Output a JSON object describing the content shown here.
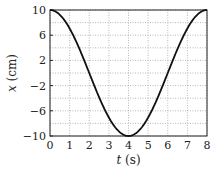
{
  "chart_data": {
    "type": "line",
    "title": "",
    "xlabel": "t (s)",
    "ylabel": "x (cm)",
    "xlim": [
      0,
      8
    ],
    "ylim": [
      -10,
      10
    ],
    "grid": true,
    "legend": null,
    "x_ticks": [
      0,
      1,
      2,
      3,
      4,
      5,
      6,
      7,
      8
    ],
    "y_ticks": [
      -10,
      -6,
      -2,
      2,
      6,
      10
    ],
    "y_gridlines": [
      -10,
      -8,
      -6,
      -4,
      -2,
      0,
      2,
      4,
      6,
      8,
      10
    ],
    "series": [
      {
        "name": "x(t)",
        "description": "cosine oscillation, amplitude 10 cm, period 8 s",
        "x": [
          0,
          0.5,
          1,
          1.5,
          2,
          2.5,
          3,
          3.5,
          4,
          4.5,
          5,
          5.5,
          6,
          6.5,
          7,
          7.5,
          8
        ],
        "values": [
          10,
          9.24,
          7.07,
          3.83,
          0,
          -3.83,
          -7.07,
          -9.24,
          -10,
          -9.24,
          -7.07,
          -3.83,
          0,
          3.83,
          7.07,
          9.24,
          10
        ]
      }
    ]
  },
  "labels": {
    "xlabel_italic": "t",
    "xlabel_unit": " (s)",
    "ylabel_italic": "x",
    "ylabel_unit": " (cm)"
  }
}
